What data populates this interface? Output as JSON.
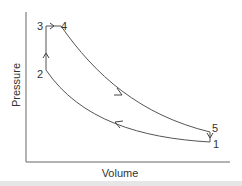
{
  "diagram": {
    "type": "pv-diagram",
    "axes": {
      "x_label": "Volume",
      "y_label": "Pressure"
    },
    "points": [
      {
        "id": "1",
        "label": "1"
      },
      {
        "id": "2",
        "label": "2"
      },
      {
        "id": "3",
        "label": "3"
      },
      {
        "id": "4",
        "label": "4"
      },
      {
        "id": "5",
        "label": "5"
      }
    ],
    "processes": [
      {
        "from": "1",
        "to": "2",
        "shape": "curve",
        "arrow": "left"
      },
      {
        "from": "2",
        "to": "3",
        "shape": "vertical",
        "arrow": "up"
      },
      {
        "from": "3",
        "to": "4",
        "shape": "horizontal",
        "arrow": "right"
      },
      {
        "from": "4",
        "to": "5",
        "shape": "curve",
        "arrow": "down-right"
      },
      {
        "from": "5",
        "to": "1",
        "shape": "vertical",
        "arrow": "down"
      }
    ],
    "colors": {
      "line": "#555555",
      "text": "#333333",
      "background": "#ffffff"
    }
  }
}
